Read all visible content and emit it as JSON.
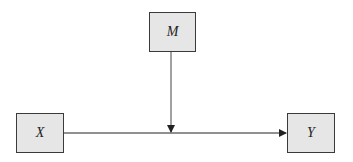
{
  "diagram": {
    "type": "moderation-model",
    "nodes": [
      {
        "id": "M",
        "label": "M",
        "role": "moderator"
      },
      {
        "id": "X",
        "label": "X",
        "role": "predictor"
      },
      {
        "id": "Y",
        "label": "Y",
        "role": "outcome"
      }
    ],
    "edges": [
      {
        "from": "X",
        "to": "Y",
        "style": "arrow"
      },
      {
        "from": "M",
        "to": "X-Y path",
        "style": "arrow"
      }
    ],
    "colors": {
      "box_fill": "#e6e6e6",
      "box_border": "#3a3a3a",
      "line": "#222222"
    }
  }
}
